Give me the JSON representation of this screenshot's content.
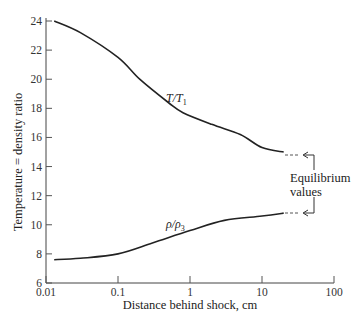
{
  "chart_data": {
    "type": "line",
    "title": "",
    "xlabel": "Distance behind shock, cm",
    "ylabel": "Temperature = density ratio",
    "xscale": "log",
    "xlim": [
      0.01,
      100
    ],
    "ylim": [
      6,
      24
    ],
    "grid": false,
    "legend": "none (inline curve labels)",
    "x_ticks": [
      "0.01",
      "0.1",
      "1",
      "10",
      "100"
    ],
    "y_ticks": [
      "6",
      "8",
      "10",
      "12",
      "14",
      "16",
      "18",
      "20",
      "22",
      "24"
    ],
    "series": [
      {
        "name": "T/T1",
        "label_main": "T/T",
        "label_sub": "1",
        "x": [
          0.013,
          0.03,
          0.1,
          0.2,
          0.5,
          0.8,
          2,
          5,
          10,
          20
        ],
        "values": [
          24.0,
          23.2,
          21.5,
          20.0,
          18.4,
          17.7,
          16.9,
          16.2,
          15.3,
          15.0
        ]
      },
      {
        "name": "rho/rho3",
        "label_main": "ρ/ρ",
        "label_sub": "3",
        "x": [
          0.013,
          0.03,
          0.1,
          0.3,
          1,
          3,
          10,
          20
        ],
        "values": [
          7.6,
          7.7,
          8.0,
          8.75,
          9.6,
          10.3,
          10.6,
          10.8
        ]
      }
    ],
    "annotations": [
      {
        "text_line1": "Equilibrium",
        "text_line2": "values",
        "points_to": [
          15.0,
          10.8
        ],
        "style": "dashed extension with bracket arrows"
      }
    ]
  }
}
